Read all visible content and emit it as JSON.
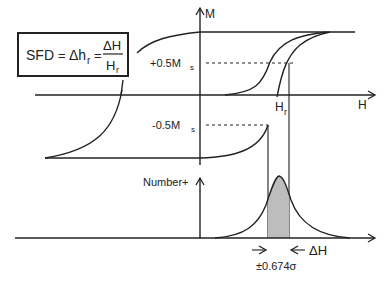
{
  "formula": {
    "lhs": "SFD",
    "eq1": "=",
    "mid_base": "Δh",
    "mid_sub": "r",
    "eq2": "=",
    "numerator": "ΔH",
    "denominator_base": "H",
    "denominator_sub": "r"
  },
  "axes": {
    "m_label": "M",
    "h_label": "H",
    "number_label": "Number+"
  },
  "annotations": {
    "plus_half_ms_prefix": "+0.5M",
    "plus_half_ms_sub": "s",
    "minus_half_ms_prefix": "-0.5M",
    "minus_half_ms_sub": "s",
    "hr_base": "H",
    "hr_sub": "r",
    "delta_h": "ΔH",
    "sigma_label": "±0.674σ"
  },
  "colors": {
    "line": "#222222",
    "shaded_area": "#bdbdbd",
    "background": "#ffffff"
  }
}
